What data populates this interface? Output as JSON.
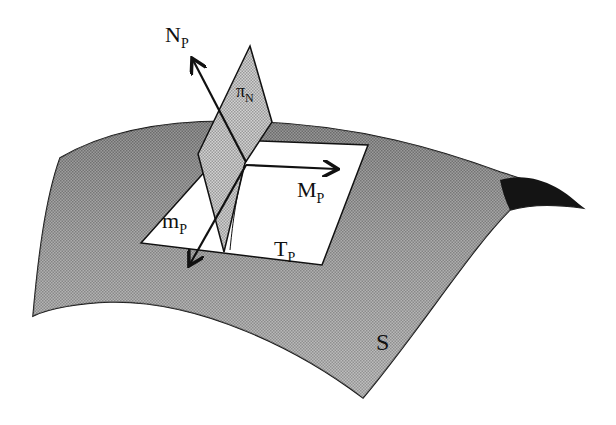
{
  "figure": {
    "labels": {
      "normal_vector": {
        "main": "N",
        "sub": "P"
      },
      "normal_plane": {
        "main": "π",
        "sub": "N"
      },
      "max_direction": {
        "main": "M",
        "sub": "P"
      },
      "min_direction": {
        "main": "m",
        "sub": "P"
      },
      "tangent_plane": {
        "main": "T",
        "sub": "P"
      },
      "surface": "S"
    },
    "colors": {
      "surface_fill": "#9a9a9a",
      "surface_dark": "#1a1a1a",
      "normal_plane_fill": "#b4b4b4",
      "tangent_plane_fill": "#ffffff",
      "stroke": "#111111"
    }
  }
}
